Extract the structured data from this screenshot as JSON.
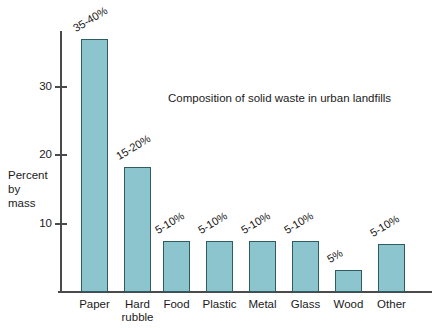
{
  "chart_data": {
    "type": "bar",
    "title": "Composition of solid waste in urban landfills",
    "xlabel": "",
    "ylabel": "Percent by mass",
    "ylabel_lines": [
      "Percent",
      "by",
      "mass"
    ],
    "categories": [
      "Paper",
      "Hard rubble",
      "Food",
      "Plastic",
      "Metal",
      "Glass",
      "Wood",
      "Other"
    ],
    "category_labels": [
      "Paper",
      "Hard\nrubble",
      "Food",
      "Plastic",
      "Metal",
      "Glass",
      "Wood",
      "Other"
    ],
    "values": [
      37,
      18.2,
      7.5,
      7.5,
      7.5,
      7.5,
      3.2,
      7
    ],
    "value_labels": [
      "35-40%",
      "15-20%",
      "5-10%",
      "5-10%",
      "5-10%",
      "5-10%",
      "5%",
      "5-10%"
    ],
    "ylim": [
      0,
      42
    ],
    "yticks": [
      10,
      20,
      30
    ],
    "ytick_labels": [
      "10",
      "20",
      "30"
    ],
    "grid": false,
    "legend": "none",
    "bar_color": "#8dc5ce",
    "bar_border_color": "#2f5b63",
    "axis_color": "#4a4a4a",
    "text_color": "#1a1a1a",
    "background": "#ffffff"
  }
}
